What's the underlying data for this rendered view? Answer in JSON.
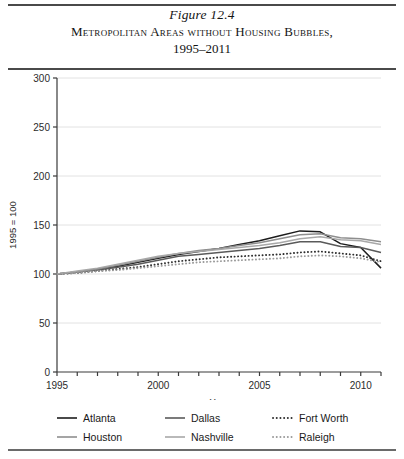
{
  "figure": {
    "number": "Figure 12.4",
    "title": "Metropolitan Areas without Housing Bubbles,",
    "years": "1995–2011"
  },
  "chart_data": {
    "type": "line",
    "title": "Metropolitan Areas without Housing Bubbles, 1995–2011",
    "xlabel": "Year",
    "ylabel": "1995 = 100",
    "xlim": [
      1995,
      2011
    ],
    "ylim": [
      0,
      300
    ],
    "yticks": [
      0,
      50,
      100,
      150,
      200,
      250,
      300
    ],
    "ytick_labels": [
      "0",
      "50",
      "100",
      "150",
      "200",
      "250",
      "300"
    ],
    "xticks": [
      1995,
      1996,
      1997,
      1998,
      1999,
      2000,
      2001,
      2002,
      2003,
      2004,
      2005,
      2006,
      2007,
      2008,
      2009,
      2010,
      2011
    ],
    "xtick_labels_shown": [
      "1995",
      "2000",
      "2005",
      "2010"
    ],
    "grid": "horizontal",
    "legend_position": "below",
    "x": [
      1995,
      1996,
      1997,
      1998,
      1999,
      2000,
      2001,
      2002,
      2003,
      2004,
      2005,
      2006,
      2007,
      2008,
      2009,
      2010,
      2011
    ],
    "series": [
      {
        "name": "Atlanta",
        "style": "solid",
        "color": "#1c1c1c",
        "values": [
          100,
          102,
          105,
          108,
          112,
          116,
          120,
          123,
          126,
          130,
          134,
          139,
          144,
          143,
          131,
          127,
          106
        ]
      },
      {
        "name": "Dallas",
        "style": "solid",
        "color": "#5a5a5a",
        "values": [
          100,
          102,
          104,
          107,
          110,
          114,
          118,
          120,
          122,
          124,
          126,
          129,
          133,
          133,
          128,
          127,
          122
        ]
      },
      {
        "name": "Fort Worth",
        "style": "dotted",
        "color": "#2e2e2e",
        "values": [
          100,
          101,
          103,
          105,
          107,
          110,
          113,
          115,
          117,
          118,
          119,
          120,
          122,
          123,
          121,
          119,
          113
        ]
      },
      {
        "name": "Houston",
        "style": "solid",
        "color": "#8e8e8e",
        "values": [
          100,
          102,
          105,
          109,
          113,
          117,
          121,
          124,
          126,
          129,
          132,
          136,
          140,
          141,
          137,
          136,
          133
        ]
      },
      {
        "name": "Nashville",
        "style": "solid",
        "color": "#a8a8a8",
        "values": [
          100,
          103,
          106,
          110,
          114,
          118,
          121,
          123,
          125,
          127,
          129,
          132,
          136,
          138,
          135,
          134,
          130
        ]
      },
      {
        "name": "Raleigh",
        "style": "dotted",
        "color": "#9a9a9a",
        "values": [
          100,
          101,
          103,
          104,
          106,
          108,
          110,
          112,
          113,
          114,
          115,
          116,
          118,
          119,
          118,
          116,
          112
        ]
      }
    ]
  },
  "legend": {
    "items": [
      {
        "label": "Atlanta",
        "style": "solid",
        "color": "#1c1c1c"
      },
      {
        "label": "Dallas",
        "style": "solid",
        "color": "#5a5a5a"
      },
      {
        "label": "Fort Worth",
        "style": "dotted",
        "color": "#2e2e2e"
      },
      {
        "label": "Houston",
        "style": "solid",
        "color": "#8e8e8e"
      },
      {
        "label": "Nashville",
        "style": "solid",
        "color": "#a8a8a8"
      },
      {
        "label": "Raleigh",
        "style": "dotted",
        "color": "#9a9a9a"
      }
    ]
  }
}
